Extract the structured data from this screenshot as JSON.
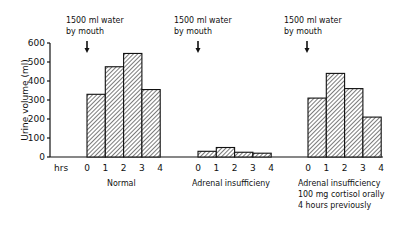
{
  "chart_data": {
    "type": "bar",
    "title": "",
    "xlabel": "hrs",
    "ylabel": "Urine volume (ml)",
    "ylim": [
      0,
      600
    ],
    "yticks": [
      0,
      100,
      200,
      300,
      400,
      500,
      600
    ],
    "grid": false,
    "legend": null,
    "bar_style": "hatched, black outline, adjacent bars (histogram)",
    "x_tick_labels": [
      "0",
      "1",
      "2",
      "3",
      "4"
    ],
    "groups": [
      {
        "name": "Normal",
        "label_lines": [
          "Normal"
        ],
        "intervals": [
          "0-1",
          "1-2",
          "2-3",
          "3-4"
        ],
        "values": [
          330,
          475,
          545,
          355
        ],
        "annotation": [
          "1500 ml water",
          "by mouth"
        ]
      },
      {
        "name": "Adrenal insufficieny",
        "label_lines": [
          "Adrenal  insufficieny"
        ],
        "intervals": [
          "0-1",
          "1-2",
          "2-3",
          "3-4"
        ],
        "values": [
          30,
          50,
          25,
          20
        ],
        "annotation": [
          "1500 ml water",
          "by mouth"
        ]
      },
      {
        "name": "Adrenal insufficiency, 100 mg cortisol orally 4 hours previously",
        "label_lines": [
          "Adrenal insufficiency",
          "100 mg cortisol orally",
          "4 hours previously"
        ],
        "intervals": [
          "0-1",
          "1-2",
          "2-3",
          "3-4"
        ],
        "values": [
          310,
          440,
          360,
          210
        ],
        "annotation": [
          "1500 ml water",
          "by mouth"
        ]
      }
    ]
  },
  "labels": {
    "ylabel": "Urine volume (ml)",
    "hrs": "hrs",
    "yticks": [
      "0",
      "100",
      "200",
      "300",
      "400",
      "500",
      "600"
    ],
    "xticks": [
      "0",
      "1",
      "2",
      "3",
      "4"
    ],
    "annotation_line1": "1500 ml water",
    "annotation_line2": "by mouth",
    "group1": "Normal",
    "group2": "Adrenal  insufficieny",
    "group3_line1": "Adrenal insufficiency",
    "group3_line2": "100 mg cortisol orally",
    "group3_line3": "4 hours previously"
  }
}
